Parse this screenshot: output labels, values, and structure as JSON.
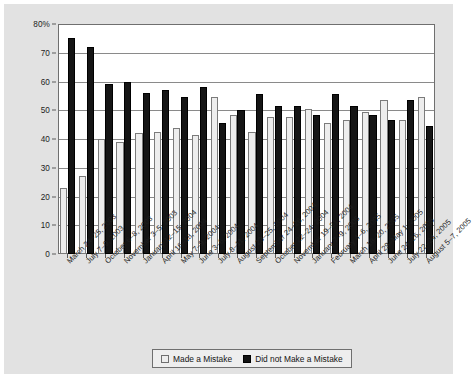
{
  "chart_data": {
    "type": "bar",
    "title": "",
    "subtitle": "",
    "xlabel": "",
    "ylabel": "",
    "ylim": [
      0,
      80
    ],
    "yticks": [
      0,
      10,
      20,
      30,
      40,
      50,
      60,
      70,
      80
    ],
    "ytick_labels": [
      "0",
      "10",
      "20",
      "30",
      "40",
      "50",
      "60",
      "70",
      "80%"
    ],
    "grid": "horizontal",
    "legend_position": "bottom-center",
    "categories": [
      "March 24–25, 2003",
      "July 7–9, 2003",
      "October 6–8, 2003",
      "November 3–5, 2003",
      "January 12–15, 2004",
      "April 16–18, 2004",
      "May 7–9, 2004",
      "June 3–6, 2004",
      "July 8–11, 2004",
      "August 23–25, 2004",
      "September 24–26, 2004",
      "October 22–24, 2004",
      "November 19–21, 2004",
      "January 7–9, 2005",
      "February 4–6, 2005",
      "March 18–20, 2005",
      "April 29–May 1, 2005",
      "June 24–26, 2005",
      "July 22–24, 2005",
      "August 5–7, 2005"
    ],
    "series": [
      {
        "name": "Made a Mistake",
        "color": "#ededed",
        "values": [
          23,
          27,
          40,
          39,
          42,
          42.5,
          44,
          41.5,
          54.5,
          48.5,
          42.5,
          47.5,
          47.5,
          50.5,
          45.5,
          46.5,
          49.5,
          53.5,
          46.5,
          54.5
        ]
      },
      {
        "name": "Did not Make a Mistake",
        "color": "#151515",
        "values": [
          75,
          72,
          59,
          60,
          56,
          57,
          54.5,
          58,
          45.5,
          50,
          55.5,
          51.5,
          51.5,
          48.5,
          55.5,
          51.5,
          48.5,
          46.5,
          53.5,
          44.5
        ]
      }
    ]
  },
  "legend": {
    "items": [
      {
        "label": "Made a Mistake",
        "swatch": "light"
      },
      {
        "label": "Did not Make a Mistake",
        "swatch": "dark"
      }
    ]
  },
  "colors": {
    "panel_background": "#e2e2e2",
    "plot_background": "#ffffff",
    "gridline": "#8a8a8a",
    "frame": "#6f6f6f",
    "series_light": "#ededed",
    "series_dark": "#151515",
    "text": "#1d1d1d"
  }
}
